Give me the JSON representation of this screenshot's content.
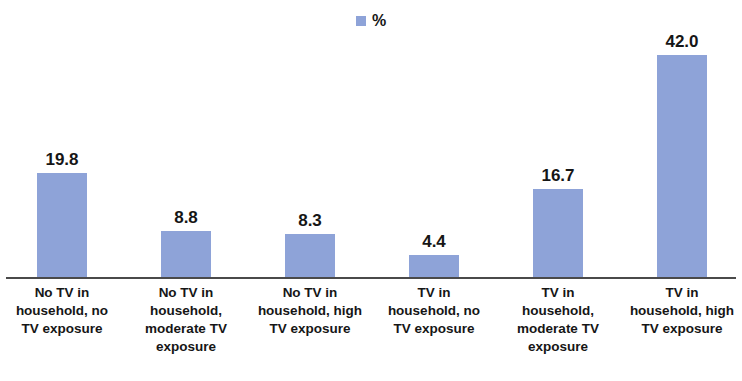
{
  "chart_data": {
    "type": "bar",
    "title": "",
    "xlabel": "",
    "ylabel": "",
    "grid": false,
    "legend_position": "top-center",
    "ylim": [
      0,
      46
    ],
    "series_color": "#8ea3d8",
    "categories": [
      "No TV in household, no TV exposure",
      "No TV in household, moderate TV exposure",
      "No TV in household, high TV exposure",
      "TV in household, no TV exposure",
      "TV in household, moderate TV exposure",
      "TV in household, high TV exposure"
    ],
    "values": [
      19.8,
      8.8,
      8.3,
      4.4,
      16.7,
      42.0
    ],
    "value_labels": [
      "19.8",
      "8.8",
      "8.3",
      "4.4",
      "16.7",
      "42.0"
    ],
    "series": [
      {
        "name": "%",
        "values": [
          19.8,
          8.8,
          8.3,
          4.4,
          16.7,
          42.0
        ]
      }
    ]
  },
  "legend": {
    "entries": [
      {
        "label": "%",
        "color": "#8ea3d8"
      }
    ]
  },
  "axis": {
    "baseline_color": "#4a4a4a"
  },
  "categories_lines": [
    [
      "No TV in",
      "household, no",
      "TV exposure"
    ],
    [
      "No TV in",
      "household,",
      "moderate TV",
      "exposure"
    ],
    [
      "No TV in",
      "household, high",
      "TV exposure"
    ],
    [
      "TV in",
      "household, no",
      "TV exposure"
    ],
    [
      "TV in",
      "household,",
      "moderate TV",
      "exposure"
    ],
    [
      "TV in",
      "household, high",
      "TV exposure"
    ]
  ]
}
